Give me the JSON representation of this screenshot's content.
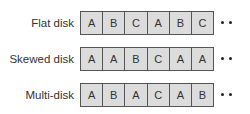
{
  "diagram": {
    "rows": [
      {
        "label": "Flat disk",
        "cells": [
          "A",
          "B",
          "C",
          "A",
          "B",
          "C"
        ],
        "continues": true
      },
      {
        "label": "Skewed disk",
        "cells": [
          "A",
          "A",
          "B",
          "C",
          "A",
          "A"
        ],
        "continues": true
      },
      {
        "label": "Multi-disk",
        "cells": [
          "A",
          "B",
          "A",
          "C",
          "A",
          "B"
        ],
        "continues": true
      }
    ],
    "colors": {
      "cell_fill": "#dcdcdc",
      "cell_border": "#555555",
      "text": "#333333"
    }
  }
}
